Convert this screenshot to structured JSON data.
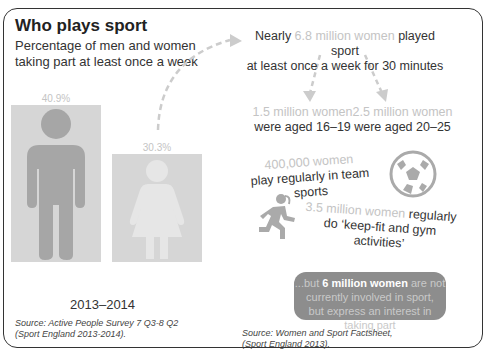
{
  "header": {
    "title": "Who plays sport",
    "subtitle": "Percentage of men and women taking part at least once a week"
  },
  "chart": {
    "men_pct": "40.9%",
    "women_pct": "30.3%",
    "period": "2013–2014",
    "source_line1": "Source: Active People Survey 7 Q3-8 Q2",
    "source_line2": "(Sport England 2013-2014)."
  },
  "facts": {
    "intro_prefix": "Nearly ",
    "intro_highlight": "6.8 million women",
    "intro_suffix": " played sport",
    "intro_line2": "at least once a week for 30 minutes",
    "age1_highlight": "1.5 million women",
    "age1_text": "were aged 16–19",
    "age2_highlight": "2.5 million women",
    "age2_text": "were aged 20–25",
    "team_highlight": "400,000 women",
    "team_text": "play regularly in team sports",
    "gym_highlight": "3.5 million women",
    "gym_suffix": " regularly",
    "gym_text": "do ‘keep-fit and gym activities’",
    "box_prefix": "...but ",
    "box_highlight": "6 million women",
    "box_suffix": " are not",
    "box_line2": "currently involved in sport,",
    "box_line3": "but express an interest in taking part",
    "source_line1": "Source: Women and Sport Factsheet,",
    "source_line2": "(Sport England 2013)."
  },
  "icons": [
    "man-figure-icon",
    "woman-figure-icon",
    "football-icon",
    "runner-icon",
    "dashed-arrow-icon"
  ],
  "colors": {
    "bar": "#d6d6d6",
    "figure_man": "#a6a6a6",
    "figure_woman": "#e6e6e6",
    "highlight": "#c4c4c4",
    "box": "#8d8d8d"
  }
}
